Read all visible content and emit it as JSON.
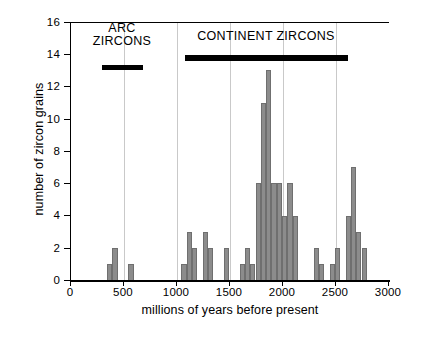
{
  "chart_data": {
    "type": "bar",
    "title": "",
    "xlabel": "millions of years before present",
    "ylabel": "number of zircon grains",
    "xlim": [
      0,
      3000
    ],
    "ylim": [
      0,
      16
    ],
    "xticks": [
      0,
      500,
      1000,
      1500,
      2000,
      2500,
      3000
    ],
    "yticks": [
      0,
      2,
      4,
      6,
      8,
      10,
      12,
      14,
      16
    ],
    "xticklabels": [
      "0",
      "500",
      "1000",
      "1500",
      "2000",
      "2500",
      "3000"
    ],
    "yticklabels": [
      "0",
      "2",
      "4",
      "6",
      "8",
      "10",
      "12",
      "14",
      "16"
    ],
    "grid": "vertical gridlines at 500 Ma intervals",
    "bin_width": 50,
    "bar_color": "#8c8c8c",
    "bins": [
      {
        "start": 350,
        "value": 1
      },
      {
        "start": 400,
        "value": 2
      },
      {
        "start": 550,
        "value": 1
      },
      {
        "start": 1050,
        "value": 1
      },
      {
        "start": 1100,
        "value": 3
      },
      {
        "start": 1150,
        "value": 2
      },
      {
        "start": 1250,
        "value": 3
      },
      {
        "start": 1300,
        "value": 2
      },
      {
        "start": 1450,
        "value": 2
      },
      {
        "start": 1600,
        "value": 1
      },
      {
        "start": 1650,
        "value": 2
      },
      {
        "start": 1700,
        "value": 1
      },
      {
        "start": 1750,
        "value": 6
      },
      {
        "start": 1800,
        "value": 11
      },
      {
        "start": 1850,
        "value": 13
      },
      {
        "start": 1900,
        "value": 6
      },
      {
        "start": 1950,
        "value": 6
      },
      {
        "start": 2000,
        "value": 4
      },
      {
        "start": 2050,
        "value": 6
      },
      {
        "start": 2100,
        "value": 4
      },
      {
        "start": 2300,
        "value": 2
      },
      {
        "start": 2350,
        "value": 1
      },
      {
        "start": 2450,
        "value": 1
      },
      {
        "start": 2500,
        "value": 2
      },
      {
        "start": 2600,
        "value": 4
      },
      {
        "start": 2650,
        "value": 7
      },
      {
        "start": 2700,
        "value": 3
      },
      {
        "start": 2750,
        "value": 2
      }
    ],
    "annotations": [
      {
        "id": "arc",
        "label_lines": [
          "ARC",
          "ZIRCONS"
        ],
        "bar_start": 300,
        "bar_end": 690,
        "color": "#000000"
      },
      {
        "id": "continent",
        "label_lines": [
          "CONTINENT ZIRCONS"
        ],
        "bar_start": 1080,
        "bar_end": 2620,
        "color": "#000000"
      }
    ]
  }
}
